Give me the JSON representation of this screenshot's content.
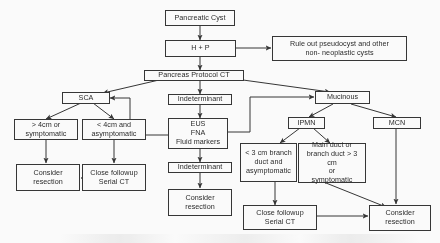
{
  "diagram": {
    "type": "flowchart",
    "stroke_color": "#2e2e2e",
    "text_color": "#1c1c1c",
    "background_color": "#ffffff"
  },
  "nodes": {
    "pancreatic_cyst": "Pancreatic Cyst",
    "h_p": "H + P",
    "rule_out": "Rule out pseudocyst and other\nnon- neoplastic cysts",
    "pancreas_protocol_ct": "Pancreas Protocol CT",
    "sca": "SCA",
    "indeterminate_top": "Indeterminant",
    "mucinous": "Mucinous",
    "gt4cm": "> 4cm or\nsymptomatic",
    "lt4cm": "< 4cm and\nasymptomatic",
    "eus_fna": "EUS\nFNA\nFluid markers",
    "ipmn": "IPMN",
    "mcn": "MCN",
    "consider_resection_left": "Consider\nresection",
    "close_followup_left": "Close followup\nSerial CT",
    "indeterminate_bottom": "Indeterminant",
    "consider_resection_center": "Consider\nresection",
    "branch_small": "< 3 cm branch\nduct and\nasymptomatic",
    "branch_large": "Main duct or\nbranch duct > 3 cm\nor\nsymptomatic",
    "close_followup_right": "Close followup\nSerial CT",
    "consider_resection_right": "Consider\nresection"
  }
}
